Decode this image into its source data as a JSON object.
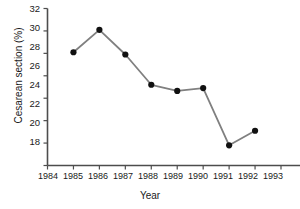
{
  "chart_data": {
    "type": "line",
    "title": "",
    "xlabel": "Year",
    "ylabel": "Cesarean section (%)",
    "x": [
      1985,
      1986,
      1987,
      1988,
      1989,
      1990,
      1991,
      1992
    ],
    "values": [
      28.1,
      30.1,
      27.9,
      25.2,
      24.65,
      24.9,
      19.8,
      21.1
    ],
    "series": [
      {
        "name": "Cesarean section (%)",
        "values": [
          28.1,
          30.1,
          27.9,
          25.2,
          24.65,
          24.9,
          19.8,
          21.1
        ]
      }
    ],
    "xlim": [
      1984,
      1993
    ],
    "ylim": [
      18,
      32
    ],
    "xticks": [
      1984,
      1985,
      1986,
      1987,
      1988,
      1989,
      1990,
      1991,
      1992,
      1993
    ],
    "xtick_labels": [
      "1984",
      "1985",
      "1986",
      "1987",
      "1988",
      "1989",
      "1990",
      "1991",
      "1992",
      "1993"
    ],
    "yticks": [
      18,
      20,
      22,
      24,
      26,
      28,
      30,
      32
    ],
    "ytick_labels": [
      "18",
      "20",
      "22",
      "24",
      "26",
      "28",
      "30",
      "32"
    ],
    "grid": false,
    "legend": "none",
    "line_color": "#808080",
    "marker_color": "#111111",
    "axis_color": "#4d4d4d",
    "background": "#ffffff"
  }
}
